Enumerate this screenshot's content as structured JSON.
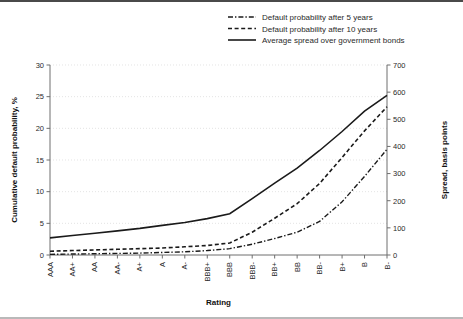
{
  "chart_data": {
    "type": "line",
    "title": "",
    "xlabel": "Rating",
    "ylabel": "Cumulative default probability, %",
    "y2label": "Spread, basis points",
    "categories": [
      "AAA",
      "AA+",
      "AA",
      "AA-",
      "A+",
      "A",
      "A-",
      "BBB+",
      "BBB",
      "BBB-",
      "BB+",
      "BB",
      "BB-",
      "B+",
      "B",
      "B-"
    ],
    "ylim": [
      0,
      30
    ],
    "yticks": [
      0,
      5,
      10,
      15,
      20,
      25,
      30
    ],
    "y2lim": [
      0,
      700
    ],
    "y2ticks": [
      0,
      100,
      200,
      300,
      400,
      500,
      600,
      700
    ],
    "grid": true,
    "legend_position": "top-right",
    "series": [
      {
        "name": "Default probability after 5 years",
        "style": "dashdot",
        "axis": "left",
        "values": [
          0.1,
          0.15,
          0.2,
          0.25,
          0.3,
          0.4,
          0.5,
          0.7,
          1.0,
          1.7,
          2.6,
          3.6,
          5.3,
          8.4,
          12.4,
          16.7
        ]
      },
      {
        "name": "Default probability after 10 years",
        "style": "dashed",
        "axis": "left",
        "values": [
          0.6,
          0.7,
          0.8,
          0.9,
          1.0,
          1.1,
          1.3,
          1.5,
          1.9,
          3.6,
          5.8,
          8.1,
          11.3,
          15.4,
          19.6,
          23.4
        ]
      },
      {
        "name": "Average spread over government bonds",
        "style": "solid",
        "axis": "right",
        "values": [
          63,
          72,
          80,
          89,
          98,
          109,
          120,
          134,
          152,
          208,
          265,
          320,
          385,
          455,
          530,
          588
        ]
      }
    ],
    "legend": [
      {
        "label": "Default probability after 5 years",
        "style": "dashdot"
      },
      {
        "label": "Default probability after 10 years",
        "style": "dashed"
      },
      {
        "label": "Average spread over government bonds",
        "style": "solid"
      }
    ]
  }
}
